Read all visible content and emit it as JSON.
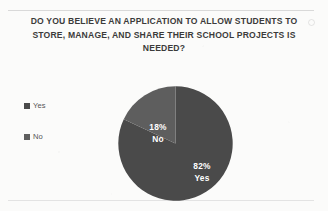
{
  "chart_data": {
    "type": "pie",
    "title": "DO YOU BELIEVE AN APPLICATION TO ALLOW STUDENTS TO STORE, MANAGE, AND SHARE THEIR SCHOOL PROJECTS IS NEEDED?",
    "title_lines": [
      "DO YOU BELIEVE AN APPLICATION TO ALLOW STUDENTS TO",
      "STORE, MANAGE, AND SHARE THEIR SCHOOL PROJECTS IS",
      "NEEDED?"
    ],
    "categories": [
      "Yes",
      "No"
    ],
    "values": [
      82,
      18
    ],
    "value_unit": "%",
    "data_labels": [
      {
        "percent": "82%",
        "name": "Yes"
      },
      {
        "percent": "18%",
        "name": "No"
      }
    ],
    "colors": [
      "#4a4a4a",
      "#5e5e5e"
    ],
    "legend": {
      "position": "left",
      "entries": [
        {
          "label": "Yes",
          "color": "#4a4a4a"
        },
        {
          "label": "No",
          "color": "#5e5e5e"
        }
      ]
    },
    "start_angle_deg": 0,
    "direction": "clockwise",
    "xlabel": "",
    "ylabel": "",
    "grid": false
  },
  "slice_label_yes": {
    "percent": "82%",
    "name": "Yes"
  },
  "slice_label_no": {
    "percent": "18%",
    "name": "No"
  }
}
